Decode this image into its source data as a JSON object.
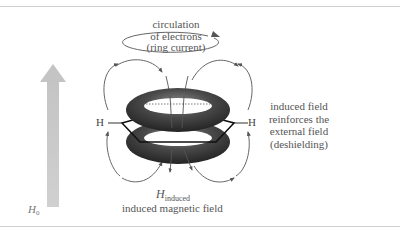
{
  "diagram": {
    "ring_current_label": [
      "circulation",
      "of electrons",
      "(ring current)"
    ],
    "right_label": [
      "induced field",
      "reinforces the",
      "external field",
      "(deshielding)"
    ],
    "hydrogen_left": "H",
    "hydrogen_right": "H",
    "h_induced_symbol": "H",
    "h_induced_subscript": "induced",
    "induced_field_label": "induced magnetic field",
    "external_field_symbol": "H",
    "external_field_subscript": "0",
    "colors": {
      "external_arrow": "#c8c8c8",
      "torus": "#3a3a3a",
      "field_lines": "#555555",
      "text": "#555555",
      "rule": "#cfcfcf"
    }
  }
}
